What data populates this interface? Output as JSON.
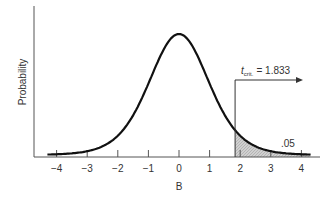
{
  "chart_data": {
    "type": "line",
    "title": "",
    "xlabel": "B",
    "ylabel": "Probability",
    "xlim": [
      -4.3,
      4.3
    ],
    "x_ticks": [
      -4,
      -3,
      -2,
      -1,
      0,
      1,
      2,
      3,
      4
    ],
    "x_tick_labels": [
      "−4",
      "−3",
      "−2",
      "−1",
      "0",
      "1",
      "2",
      "3",
      "4"
    ],
    "grid": false,
    "series": [
      {
        "name": "t distribution density",
        "x": [
          -4.3,
          -4,
          -3.5,
          -3,
          -2.5,
          -2,
          -1.5,
          -1,
          -0.5,
          0,
          0.5,
          1,
          1.5,
          2,
          2.5,
          3,
          3.5,
          4,
          4.3
        ],
        "values": [
          0.01,
          0.014,
          0.022,
          0.04,
          0.068,
          0.12,
          0.2,
          0.31,
          0.42,
          0.46,
          0.42,
          0.31,
          0.2,
          0.12,
          0.068,
          0.04,
          0.022,
          0.014,
          0.01
        ]
      }
    ],
    "annotations": [
      {
        "type": "critical_value",
        "label_main": "t",
        "label_sub": "crit.",
        "label_value": "= 1.833",
        "x": 1.833,
        "arrow_direction": "right"
      },
      {
        "type": "shaded_region",
        "from": 1.833,
        "to": 4.3,
        "label": ".05"
      }
    ]
  },
  "labels": {
    "ylabel": "Probability",
    "xlabel": "B",
    "crit_t": "t",
    "crit_sub": "crit.",
    "crit_value": "= 1.833",
    "tail_area": ".05"
  },
  "colors": {
    "curve": "#111111",
    "axis": "#555555",
    "shade": "#c8c8c8"
  }
}
